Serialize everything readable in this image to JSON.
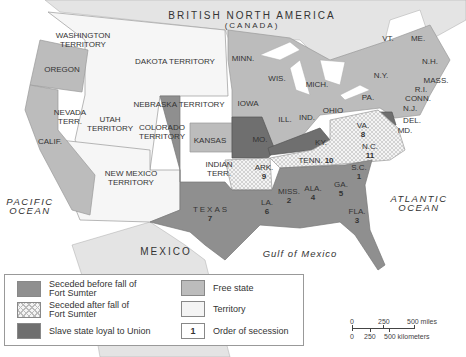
{
  "colors": {
    "seceded_before": "#8f8f8f",
    "seceded_after": "#f4f4f4",
    "loyal_slave": "#6f6f6f",
    "free": "#bcbcbc",
    "territory": "#f6f6f6",
    "foreign": "#e4e4e4",
    "water": "#ffffff"
  },
  "regions": {
    "british_na": "BRITISH NORTH AMERICA",
    "canada": "(CANADA)",
    "mexico": "MEXICO",
    "pacific": [
      "PACIFIC",
      "OCEAN"
    ],
    "atlantic": [
      "ATLANTIC",
      "OCEAN"
    ],
    "gulf": "Gulf of Mexico"
  },
  "territories": {
    "washington": [
      "WASHINGTON",
      "TERRITORY"
    ],
    "dakota": "DAKOTA TERRITORY",
    "nebraska": "NEBRASKA TERRITORY",
    "nevada": [
      "NEVADA",
      "TERR."
    ],
    "utah": [
      "UTAH",
      "TERRITORY"
    ],
    "colorado": [
      "COLORADO",
      "TERRITORY"
    ],
    "new_mexico": [
      "NEW MEXICO",
      "TERRITORY"
    ],
    "indian": [
      "INDIAN",
      "TERR."
    ]
  },
  "free_states": {
    "oregon": "OREGON",
    "calif": "CALIF.",
    "kansas": "KANSAS",
    "minn": "MINN.",
    "wis": "WIS.",
    "iowa": "IOWA",
    "mich": "MICH.",
    "ill": "ILL.",
    "ind": "IND.",
    "ohio": "OHIO",
    "pa": "PA.",
    "ny": "N.Y.",
    "vt": "VT.",
    "me": "ME.",
    "nh": "N.H.",
    "mass": "MASS.",
    "ri": "R.I.",
    "conn": "CONN.",
    "nj": "N.J."
  },
  "loyal_states": {
    "mo": "MO.",
    "ky": "KY.",
    "del": "DEL.",
    "md": "MD."
  },
  "seceded_states": [
    {
      "name": "S.C.",
      "order": "1"
    },
    {
      "name": "MISS.",
      "order": "2"
    },
    {
      "name": "FLA.",
      "order": "3"
    },
    {
      "name": "ALA.",
      "order": "4"
    },
    {
      "name": "GA.",
      "order": "5"
    },
    {
      "name": "LA.",
      "order": "6"
    },
    {
      "name": "TEXAS",
      "order": "7"
    },
    {
      "name": "VA.",
      "order": "8"
    },
    {
      "name": "ARK.",
      "order": "9"
    },
    {
      "name": "TENN.",
      "order": "10"
    },
    {
      "name": "N.C.",
      "order": "11"
    }
  ],
  "legend": {
    "seceded_before": [
      "Seceded before fall of",
      "Fort Sumter"
    ],
    "seceded_after": [
      "Seceded after fall of",
      "Fort Sumter"
    ],
    "loyal": "Slave state loyal to Union",
    "free": "Free state",
    "territory": "Territory",
    "order_sample": "1",
    "order": "Order of secession"
  },
  "scale": {
    "miles": [
      "0",
      "250",
      "500 miles"
    ],
    "km": [
      "0",
      "250",
      "500 kilometers"
    ]
  }
}
